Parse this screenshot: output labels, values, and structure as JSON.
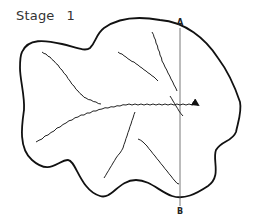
{
  "title": {
    "label": "Stage",
    "number": "1"
  },
  "section_line": {
    "top_label": "A",
    "bottom_label": "B"
  },
  "colors": {
    "outline": "#111111",
    "river": "#222222",
    "section": "#555555",
    "text": "#333333"
  }
}
